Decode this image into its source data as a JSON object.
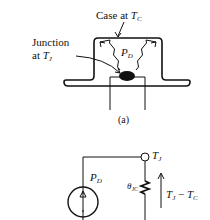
{
  "figure_a": {
    "case_label_prefix": "Case at ",
    "case_symbol": "T",
    "case_sub": "C",
    "junction_line1": "Junction",
    "junction_line2_prefix": "at ",
    "junction_symbol": "T",
    "junction_sub": "J",
    "power_symbol": "P",
    "power_sub": "D",
    "caption": "(a)"
  },
  "figure_b": {
    "node_symbol": "T",
    "node_sub": "J",
    "source_symbol": "P",
    "source_sub": "D",
    "resistor_symbol": "θ",
    "resistor_sub": "JC",
    "drop_T1": "T",
    "drop_T1_sub": "J",
    "drop_minus": " − ",
    "drop_T2": "T",
    "drop_T2_sub": "C"
  },
  "colors": {
    "ink": "#111111",
    "background": "#ffffff"
  }
}
